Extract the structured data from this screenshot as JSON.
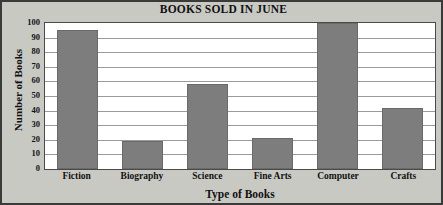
{
  "chart_data": {
    "type": "bar",
    "title": "BOOKS SOLD IN JUNE",
    "xlabel": "Type of Books",
    "ylabel": "Number of Books",
    "categories": [
      "Fiction",
      "Biography",
      "Science",
      "Fine Arts",
      "Computer",
      "Crafts"
    ],
    "values": [
      95,
      19,
      58,
      21,
      100,
      42
    ],
    "ylim": [
      0,
      100
    ],
    "ytick_labels": [
      "100",
      "90",
      "80",
      "70",
      "60",
      "50",
      "40",
      "30",
      "20",
      "10",
      "0"
    ],
    "ytick_values": [
      100,
      90,
      80,
      70,
      60,
      50,
      40,
      30,
      20,
      10,
      0
    ],
    "ytick_interval": 10,
    "grid": true,
    "grid_axis": "y",
    "legend": false,
    "series": [
      {
        "name": "Books Sold",
        "values": [
          95,
          19,
          58,
          21,
          100,
          42
        ]
      }
    ],
    "colors": {
      "bar_fill": "#7d7d7d",
      "bar_border": "#6a6a6a",
      "plot_background": "#ffffff",
      "figure_background": "#c9c9c4",
      "gridline": "#9a9a9a",
      "axis_border": "#4a4a4a",
      "text": "#111111"
    }
  }
}
